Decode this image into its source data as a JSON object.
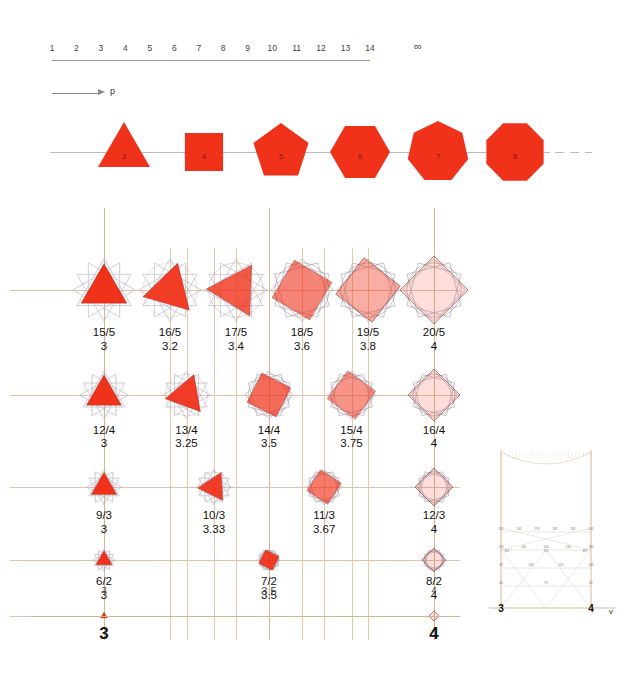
{
  "numberline": {
    "name": "p-index-axis",
    "ticks": [
      "1",
      "2",
      "3",
      "4",
      "5",
      "6",
      "7",
      "8",
      "9",
      "10",
      "11",
      "12",
      "13",
      "14"
    ],
    "infinity": "∞"
  },
  "arrow": {
    "label": "p"
  },
  "polygon_strip": {
    "name": "regular-polygon-sequence",
    "fill_color": "#F0321A",
    "items": [
      {
        "label": "3",
        "sides": 3
      },
      {
        "label": "4",
        "sides": 4
      },
      {
        "label": "5",
        "sides": 5
      },
      {
        "label": "6",
        "sides": 6
      },
      {
        "label": "7",
        "sides": 7
      },
      {
        "label": "8",
        "sides": 8
      }
    ]
  },
  "chart_data": {
    "type": "scatter",
    "title": "",
    "xlabel": "v",
    "ylabel": "",
    "xlim": [
      3,
      4
    ],
    "grid": true,
    "axis_end_labels": [
      "3",
      "4"
    ],
    "midpoint_label": "3.5",
    "rows": [
      {
        "denominator": 5,
        "cells": [
          {
            "fraction": "15/5",
            "value": "3",
            "x": 3.0,
            "opacity": 1.0
          },
          {
            "fraction": "16/5",
            "value": "3.2",
            "x": 3.2,
            "opacity": 0.95
          },
          {
            "fraction": "17/5",
            "value": "3.4",
            "x": 3.4,
            "opacity": 0.8
          },
          {
            "fraction": "18/5",
            "value": "3.6",
            "x": 3.6,
            "opacity": 0.6
          },
          {
            "fraction": "19/5",
            "value": "3.8",
            "x": 3.8,
            "opacity": 0.4
          },
          {
            "fraction": "20/5",
            "value": "4",
            "x": 4.0,
            "opacity": 0.16
          }
        ]
      },
      {
        "denominator": 4,
        "cells": [
          {
            "fraction": "12/4",
            "value": "3",
            "x": 3.0,
            "opacity": 1.0
          },
          {
            "fraction": "13/4",
            "value": "3.25",
            "x": 3.25,
            "opacity": 0.95
          },
          {
            "fraction": "14/4",
            "value": "3.5",
            "x": 3.5,
            "opacity": 0.72
          },
          {
            "fraction": "15/4",
            "value": "3.75",
            "x": 3.75,
            "opacity": 0.52
          },
          {
            "fraction": "16/4",
            "value": "4",
            "x": 4.0,
            "opacity": 0.16
          }
        ]
      },
      {
        "denominator": 3,
        "cells": [
          {
            "fraction": "9/3",
            "value": "3",
            "x": 3.0,
            "opacity": 1.0
          },
          {
            "fraction": "10/3",
            "value": "3.33",
            "x": 3.333,
            "opacity": 0.95
          },
          {
            "fraction": "11/3",
            "value": "3.67",
            "x": 3.667,
            "opacity": 0.65
          },
          {
            "fraction": "12/3",
            "value": "4",
            "x": 4.0,
            "opacity": 0.16
          }
        ]
      },
      {
        "denominator": 2,
        "cells": [
          {
            "fraction": "6/2",
            "value": "3",
            "x": 3.0,
            "opacity": 1.0
          },
          {
            "fraction": "7/2",
            "value": "3.5",
            "x": 3.5,
            "opacity": 0.95
          },
          {
            "fraction": "8/2",
            "value": "4",
            "x": 4.0,
            "opacity": 0.16
          }
        ]
      },
      {
        "denominator": 1,
        "cells": [
          {
            "fraction": "",
            "value": "",
            "x": 3.0,
            "opacity": 1.0
          },
          {
            "fraction": "",
            "value": "",
            "x": 4.0,
            "opacity": 0.16
          }
        ]
      }
    ]
  },
  "inset": {
    "name": "stern-brocot-inset",
    "axis_label": "v",
    "left_label": "3",
    "right_label": "4",
    "fraction_rows": [
      [
        "6/2",
        "7/2",
        "8/2"
      ],
      [
        "9/3",
        "10/3",
        "11/3",
        "12/3"
      ],
      [
        "12/4",
        "13/4",
        "14/4",
        "15/4",
        "16/4"
      ],
      [
        "15/5",
        "16/5",
        "17/5",
        "18/5",
        "19/5",
        "20/5"
      ]
    ]
  }
}
